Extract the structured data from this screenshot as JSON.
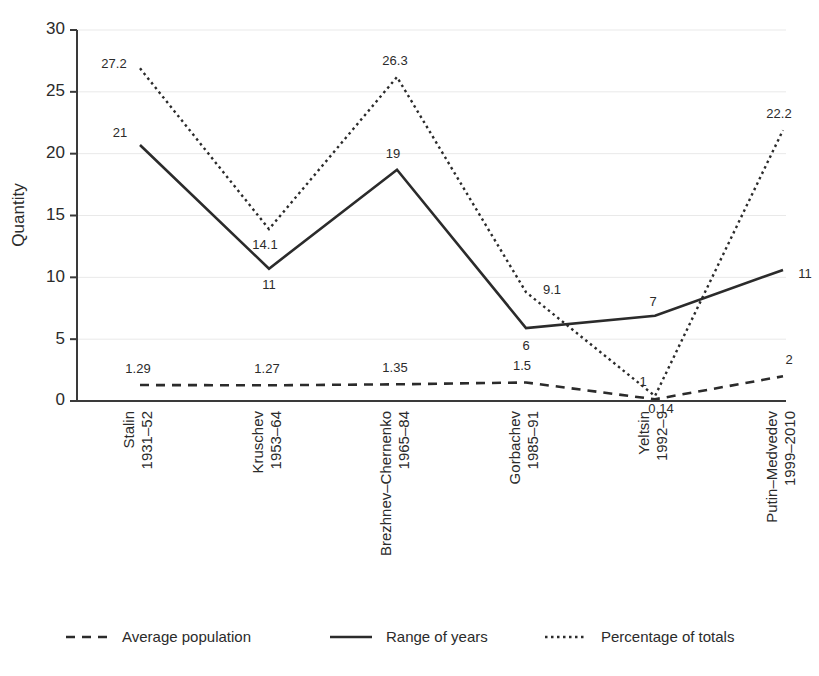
{
  "chart_data": {
    "type": "line",
    "title": "",
    "xlabel": "",
    "ylabel": "Quantity",
    "ylim": [
      0,
      30
    ],
    "yticks": [
      0,
      5,
      10,
      15,
      20,
      25,
      30
    ],
    "grid": true,
    "legend_position": "bottom",
    "categories": [
      "Stalin\n1931–52",
      "Kruschev\n1953–64",
      "Brezhnev–Chernenko\n1965–84",
      "Gorbachev\n1985–91",
      "Yeltsin\n1992–9",
      "Putin–Medvedev\n1999–2010"
    ],
    "category_names": [
      "Stalin",
      "Kruschev",
      "Brezhnev–Chernenko",
      "Gorbachev",
      "Yeltsin",
      "Putin–Medvedev"
    ],
    "category_years": [
      "1931–52",
      "1953–64",
      "1965–84",
      "1985–91",
      "1992–9",
      "1999–2010"
    ],
    "series": [
      {
        "name": "Average population",
        "style": "dashed",
        "values": [
          1.29,
          1.27,
          1.35,
          1.5,
          0.14,
          2
        ],
        "labels": [
          "1.29",
          "1.27",
          "1.35",
          "1.5",
          "0.14",
          "2"
        ]
      },
      {
        "name": "Range of years",
        "style": "solid",
        "values": [
          20.7,
          10.7,
          18.7,
          5.9,
          6.9,
          10.6
        ],
        "labels": [
          "21",
          "11",
          "19",
          "6",
          "7",
          "11"
        ]
      },
      {
        "name": "Percentage of totals",
        "style": "dotted",
        "values": [
          26.9,
          13.9,
          26.2,
          8.8,
          0.4,
          21.9
        ],
        "labels": [
          "27.2",
          "14.1",
          "26.3",
          "9.1",
          "1",
          "22.2"
        ]
      }
    ]
  },
  "legend": {
    "items": [
      {
        "label": "Average population",
        "style": "dashed"
      },
      {
        "label": "Range of years",
        "style": "solid"
      },
      {
        "label": "Percentage of totals",
        "style": "dotted"
      }
    ]
  },
  "axis": {
    "y_title": "Quantity",
    "y_tick_labels": [
      "0",
      "5",
      "10",
      "15",
      "20",
      "25",
      "30"
    ]
  }
}
